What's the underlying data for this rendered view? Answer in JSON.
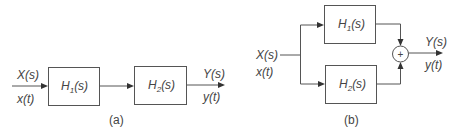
{
  "diagram_a": {
    "caption": "(a)",
    "input": {
      "freq": "X(s)",
      "time": "x(t)"
    },
    "block1": {
      "base": "H",
      "sub": "1",
      "arg": "(s)"
    },
    "block2": {
      "base": "H",
      "sub": "2",
      "arg": "(s)"
    },
    "output": {
      "freq": "Y(s)",
      "time": "y(t)"
    }
  },
  "diagram_b": {
    "caption": "(b)",
    "input": {
      "freq": "X(s)",
      "time": "x(t)"
    },
    "block1": {
      "base": "H",
      "sub": "1",
      "arg": "(s)"
    },
    "block2": {
      "base": "H",
      "sub": "2",
      "arg": "(s)"
    },
    "sum_symbol": "+",
    "output": {
      "freq": "Y(s)",
      "time": "y(t)"
    }
  },
  "colors": {
    "line": "#555555",
    "text": "#444444",
    "arrow": "#333333"
  }
}
